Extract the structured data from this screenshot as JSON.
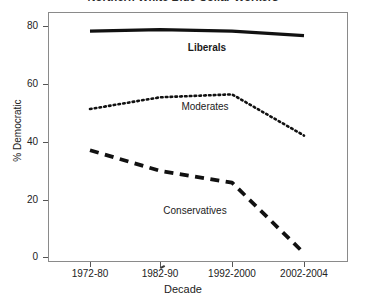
{
  "chart_data": {
    "type": "line",
    "title": "Northern White Blue Collar Workers",
    "xlabel": "Decade",
    "ylabel": "% Democratic",
    "categories": [
      "1972-80",
      "1982-90",
      "1992-2000",
      "2002-2004"
    ],
    "ylim": [
      0,
      85
    ],
    "yticks": [
      0,
      20,
      40,
      60,
      80
    ],
    "ytick_labels": [
      "0",
      "20",
      "40",
      "60",
      "80"
    ],
    "grid": false,
    "legend": "inline-labels",
    "series": [
      {
        "name": "Liberals",
        "values": [
          78.5,
          79.0,
          78.5,
          77.0
        ],
        "style": "solid",
        "color": "#111111",
        "label_position": "above-line-center"
      },
      {
        "name": "Moderates",
        "values": [
          52.0,
          56.0,
          57.0,
          43.0
        ],
        "style": "dotted",
        "color": "#111111",
        "label_position": "below-line-center"
      },
      {
        "name": "Conservatives",
        "values": [
          38.0,
          31.0,
          27.0,
          3.0
        ],
        "style": "dashed",
        "color": "#111111",
        "label_position": "below-line-center"
      }
    ]
  },
  "axes": {
    "y_title": "% Democratic",
    "x_title": "Decade",
    "y_tick_0": "0",
    "y_tick_1": "20",
    "y_tick_2": "40",
    "y_tick_3": "60",
    "y_tick_4": "80",
    "x_tick_0": "1972-80",
    "x_tick_1": "1982-90",
    "x_tick_2": "1992-2000",
    "x_tick_3": "2002-2004"
  },
  "series_labels": {
    "liberals": "Liberals",
    "moderates": "Moderates",
    "conservatives": "Conservatives"
  }
}
